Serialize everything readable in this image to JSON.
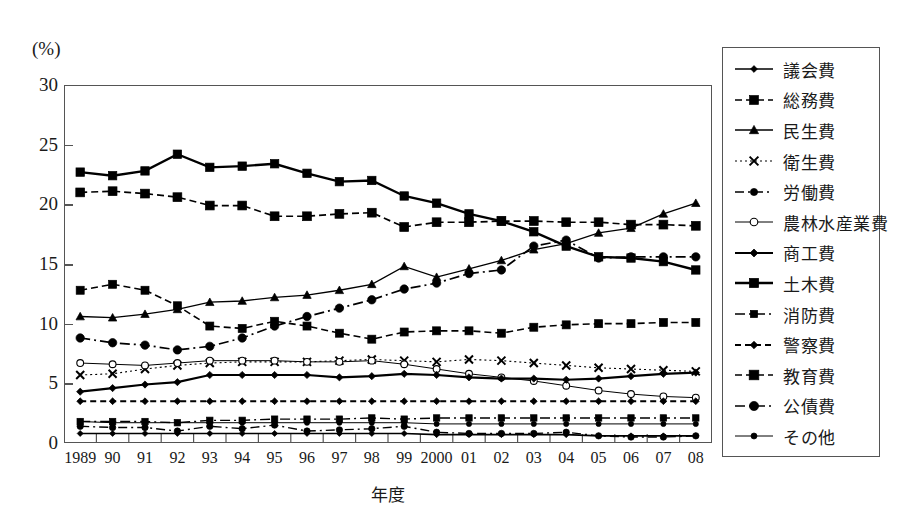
{
  "axis": {
    "unit_label": "(%)",
    "x_title": "年度",
    "y_ticks": [
      "0",
      "5",
      "10",
      "15",
      "20",
      "25",
      "30"
    ],
    "x_labels": [
      "1989",
      "90",
      "91",
      "92",
      "93",
      "94",
      "95",
      "96",
      "97",
      "98",
      "99",
      "2000",
      "01",
      "02",
      "03",
      "04",
      "05",
      "06",
      "07",
      "08"
    ]
  },
  "legend": {
    "items": [
      {
        "label": "議会費",
        "style": "solid-diamond"
      },
      {
        "label": "総務費",
        "style": "dashed-square"
      },
      {
        "label": "民生費",
        "style": "solid-triangle"
      },
      {
        "label": "衛生費",
        "style": "dotted-cross"
      },
      {
        "label": "労働費",
        "style": "dashdot-circle"
      },
      {
        "label": "農林水産業費",
        "style": "thin-opencircle"
      },
      {
        "label": "商工費",
        "style": "bold-diamond"
      },
      {
        "label": "土木費",
        "style": "bold-plain"
      },
      {
        "label": "消防費",
        "style": "dashdot-plain"
      },
      {
        "label": "警察費",
        "style": "dotted-diamond"
      },
      {
        "label": "教育費",
        "style": "dashed-bigsquare"
      },
      {
        "label": "公債費",
        "style": "dashdot-bigcircle"
      },
      {
        "label": "その他",
        "style": "solid-smalldot"
      }
    ]
  },
  "chart_data": {
    "type": "line",
    "title": "",
    "xlabel": "年度",
    "ylabel": "(%)",
    "ylim": [
      0,
      30
    ],
    "ytick_step": 5,
    "grid": false,
    "legend_position": "right",
    "x": [
      "1989",
      "90",
      "91",
      "92",
      "93",
      "94",
      "95",
      "96",
      "97",
      "98",
      "99",
      "2000",
      "01",
      "02",
      "03",
      "04",
      "05",
      "06",
      "07",
      "08"
    ],
    "series": [
      {
        "name": "議会費",
        "values": [
          0.8,
          0.8,
          0.8,
          0.8,
          0.8,
          0.8,
          0.8,
          0.8,
          0.8,
          0.8,
          0.8,
          0.7,
          0.7,
          0.7,
          0.7,
          0.7,
          0.6,
          0.6,
          0.6,
          0.6
        ]
      },
      {
        "name": "総務費",
        "values": [
          12.8,
          13.3,
          12.8,
          11.5,
          9.8,
          9.6,
          10.2,
          9.8,
          9.2,
          8.7,
          9.3,
          9.4,
          9.4,
          9.2,
          9.7,
          9.9,
          10.0,
          10.0,
          10.1,
          10.1
        ]
      },
      {
        "name": "民生費",
        "values": [
          10.6,
          10.5,
          10.8,
          11.2,
          11.8,
          11.9,
          12.2,
          12.4,
          12.8,
          13.3,
          14.8,
          13.9,
          14.6,
          15.3,
          16.2,
          16.7,
          17.6,
          18.0,
          19.2,
          20.1
        ]
      },
      {
        "name": "衛生費",
        "values": [
          5.7,
          5.8,
          6.2,
          6.5,
          6.7,
          6.8,
          6.8,
          6.8,
          6.9,
          7.0,
          6.9,
          6.8,
          7.0,
          6.9,
          6.7,
          6.5,
          6.3,
          6.2,
          6.1,
          6.0
        ]
      },
      {
        "name": "労働費",
        "values": [
          1.4,
          1.3,
          1.3,
          1.0,
          1.4,
          1.2,
          1.5,
          1.0,
          1.1,
          1.2,
          1.4,
          0.9,
          0.8,
          0.8,
          0.8,
          0.9,
          0.6,
          0.5,
          0.5,
          0.6
        ]
      },
      {
        "name": "農林水産業費",
        "values": [
          6.7,
          6.6,
          6.5,
          6.7,
          6.9,
          6.9,
          6.9,
          6.8,
          6.8,
          6.9,
          6.6,
          6.2,
          5.8,
          5.5,
          5.2,
          4.8,
          4.4,
          4.1,
          3.9,
          3.8
        ]
      },
      {
        "name": "商工費",
        "values": [
          4.3,
          4.6,
          4.9,
          5.1,
          5.7,
          5.7,
          5.7,
          5.7,
          5.5,
          5.6,
          5.8,
          5.7,
          5.5,
          5.4,
          5.4,
          5.3,
          5.4,
          5.6,
          5.8,
          5.9
        ]
      },
      {
        "name": "土木費",
        "values": [
          22.7,
          22.4,
          22.8,
          24.2,
          23.1,
          23.2,
          23.4,
          22.6,
          21.9,
          22.0,
          20.7,
          20.1,
          19.2,
          18.6,
          17.7,
          16.5,
          15.6,
          15.5,
          15.2,
          14.5
        ]
      },
      {
        "name": "消防費",
        "values": [
          1.8,
          1.8,
          1.8,
          1.7,
          1.9,
          1.9,
          2.0,
          2.0,
          2.0,
          2.1,
          2.0,
          2.1,
          2.1,
          2.1,
          2.1,
          2.1,
          2.1,
          2.1,
          2.1,
          2.1
        ]
      },
      {
        "name": "警察費",
        "values": [
          3.5,
          3.5,
          3.5,
          3.5,
          3.5,
          3.5,
          3.5,
          3.5,
          3.5,
          3.5,
          3.5,
          3.5,
          3.5,
          3.5,
          3.5,
          3.5,
          3.5,
          3.5,
          3.5,
          3.5
        ]
      },
      {
        "name": "教育費",
        "values": [
          21.0,
          21.1,
          20.9,
          20.6,
          19.9,
          19.9,
          19.0,
          19.0,
          19.2,
          19.3,
          18.1,
          18.5,
          18.5,
          18.6,
          18.6,
          18.5,
          18.5,
          18.3,
          18.3,
          18.2
        ]
      },
      {
        "name": "公債費",
        "values": [
          8.8,
          8.4,
          8.2,
          7.8,
          8.1,
          8.8,
          9.8,
          10.6,
          11.3,
          12.0,
          12.9,
          13.4,
          14.2,
          14.5,
          16.5,
          17.0,
          15.5,
          15.6,
          15.6,
          15.6
        ]
      },
      {
        "name": "その他",
        "values": [
          1.8,
          1.7,
          1.7,
          1.7,
          1.7,
          1.7,
          1.7,
          1.7,
          1.7,
          1.7,
          1.7,
          1.6,
          1.6,
          1.6,
          1.6,
          1.6,
          1.6,
          1.6,
          1.6,
          1.6
        ]
      }
    ]
  }
}
